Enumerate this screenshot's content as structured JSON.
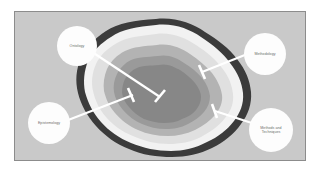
{
  "figure": {
    "type": "concentric-onion-diagram",
    "canvas_background_color": "#c9c9c9",
    "frame_border_color": "#8c8c8c",
    "page_background_color": "#ffffff"
  },
  "rings": [
    {
      "index": 0,
      "name": "outer-dark-band",
      "fill_color": "#3b3b3b",
      "position": "outermost"
    },
    {
      "index": 1,
      "name": "white-band",
      "fill_color": "#f2f2f2",
      "position": "second"
    },
    {
      "index": 2,
      "name": "light-gray-band",
      "fill_color": "#e0e0e0",
      "position": "third"
    },
    {
      "index": 3,
      "name": "medium-gray-band",
      "fill_color": "#b3b3b3",
      "position": "fourth"
    },
    {
      "index": 4,
      "name": "inner-gray-band",
      "fill_color": "#9a9a9a",
      "position": "fifth"
    },
    {
      "index": 5,
      "name": "core",
      "fill_color": "#878787",
      "position": "center"
    }
  ],
  "callouts": [
    {
      "id": "ontology",
      "label": "Ontology",
      "circle_color": "#fdfdfd",
      "text_color": "#6b6b6b",
      "leader_line_color": "#ffffff",
      "target_ring": "core"
    },
    {
      "id": "methodology",
      "label": "Methodology",
      "circle_color": "#fdfdfd",
      "text_color": "#6b6b6b",
      "leader_line_color": "#ffffff",
      "target_ring": "light-gray-band"
    },
    {
      "id": "epistemology",
      "label": "Epistemology",
      "circle_color": "#fdfdfd",
      "text_color": "#6b6b6b",
      "leader_line_color": "#ffffff",
      "target_ring": "inner-gray-band"
    },
    {
      "id": "methods-and-techniques",
      "label": "Methods and\nTechniques",
      "circle_color": "#fdfdfd",
      "text_color": "#6b6b6b",
      "leader_line_color": "#ffffff",
      "target_ring": "medium-gray-band"
    }
  ]
}
